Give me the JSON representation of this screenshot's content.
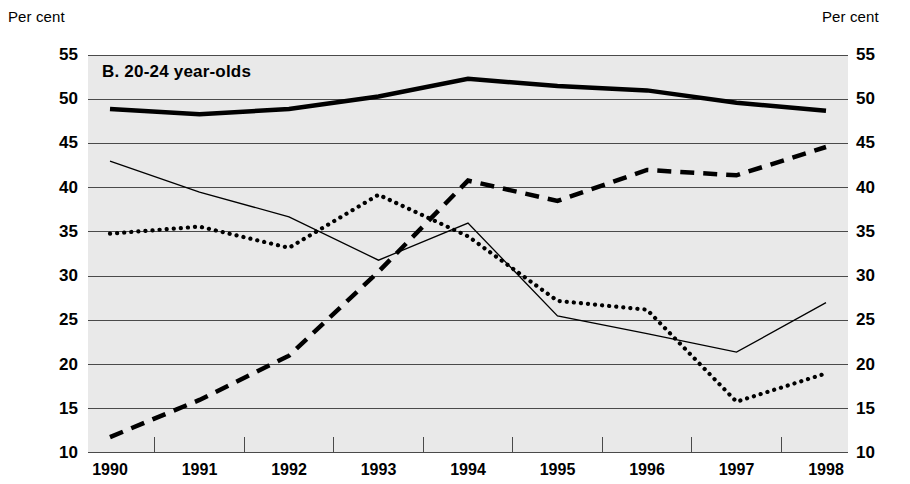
{
  "axis_captions": {
    "left": "Per cent",
    "right": "Per cent"
  },
  "panel": {
    "title": "B.  20-24 year-olds"
  },
  "chart_data": {
    "type": "line",
    "title": "B.  20-24 year-olds",
    "xlabel": "",
    "ylabel": "Per cent",
    "ylabel_right": "Per cent",
    "ylim": [
      10,
      55
    ],
    "ytick_step": 5,
    "yticks": [
      55,
      50,
      45,
      40,
      35,
      30,
      25,
      20,
      15,
      10
    ],
    "ytick_labels": [
      "55",
      "50",
      "45",
      "40",
      "35",
      "30",
      "25",
      "20",
      "15",
      "10"
    ],
    "grid": true,
    "grid_axis": "y",
    "legend": "none",
    "background": "#e9e9e9",
    "categories": [
      "1990",
      "1991",
      "1992",
      "1993",
      "1994",
      "1995",
      "1996",
      "1997",
      "1998"
    ],
    "x": [
      1990,
      1991,
      1992,
      1993,
      1994,
      1995,
      1996,
      1997,
      1998
    ],
    "series": [
      {
        "name": "thick-solid",
        "style": "solid",
        "width": 4.5,
        "color": "#000000",
        "values": [
          48.9,
          48.3,
          48.9,
          50.3,
          52.3,
          51.5,
          51.0,
          49.6,
          48.7
        ]
      },
      {
        "name": "thin-solid",
        "style": "solid",
        "width": 1.3,
        "color": "#000000",
        "values": [
          43.0,
          39.5,
          36.7,
          31.8,
          36.0,
          25.5,
          23.5,
          21.4,
          27.0
        ]
      },
      {
        "name": "dotted",
        "style": "dotted",
        "width": 4.2,
        "color": "#000000",
        "values": [
          34.8,
          35.6,
          33.2,
          39.2,
          34.5,
          27.2,
          26.2,
          15.8,
          19.0
        ]
      },
      {
        "name": "thick-dashed",
        "style": "dashed",
        "width": 4.5,
        "color": "#000000",
        "values": [
          11.8,
          16.0,
          21.0,
          30.5,
          40.8,
          38.5,
          42.0,
          41.4,
          44.6
        ]
      }
    ]
  }
}
